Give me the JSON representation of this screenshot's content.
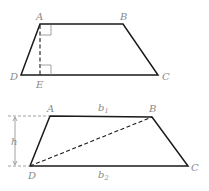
{
  "figure1": {
    "vertices": {
      "A": "A",
      "B": "B",
      "C": "C",
      "D": "D",
      "E": "E"
    },
    "description": "Trapezoid ABCD with altitude AE drawn from A to base DC, right-angle marks at A and E"
  },
  "figure2": {
    "vertices": {
      "A": "A",
      "B": "B",
      "C": "C",
      "D": "D"
    },
    "labels": {
      "h": "h",
      "b": "b",
      "b1_sub": "1",
      "b2_sub": "2"
    },
    "description": "Trapezoid ABCD with diagonal DB dashed, height h, bases b1 (top) and b2 (bottom)"
  },
  "colors": {
    "line": "#1a1a1a",
    "label": "#8a8a8a"
  }
}
